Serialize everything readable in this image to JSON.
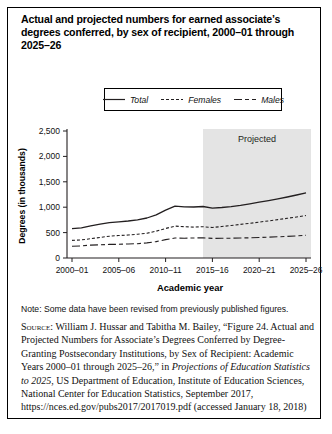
{
  "figure": {
    "title": "Actual and projected numbers for earned associate’s degrees conferred, by sex of recipient, 2000–01 through 2025–26",
    "note": "Note: Some data have been revised from previously published figures.",
    "source": {
      "label": "Source:",
      "intro": " William J. Hussar and Tabitha M. Bailey, “Figure 24. Actual and Projected Numbers for Associate’s Degrees Conferred by Degree-Granting Postsecondary Institutions, by Sex of Recipient: Academic Years 2000–01 through 2025–26,” in ",
      "italic": "Projections of Education Statistics to 2025",
      "rest": ", US Department of Education, Institute of Education Sciences, National Center for Education Statistics, September 2017, https://nces.ed.gov/pubs2017/2017019.pdf (accessed January 18, 2018)"
    }
  },
  "chart_data": {
    "type": "line",
    "title": "Actual and projected numbers for earned associate’s degrees conferred, by sex of recipient, 2000–01 through 2025–26",
    "xlabel": "Academic year",
    "ylabel": "Degrees (in thousands)",
    "ylim": [
      0,
      2500
    ],
    "yticks": [
      0,
      500,
      1000,
      1500,
      2000,
      2500
    ],
    "ytick_labels": [
      "0",
      "500",
      "1,000",
      "1,500",
      "2,000",
      "2,500"
    ],
    "xtick_labels": [
      "2000–01",
      "2005–06",
      "2010–11",
      "2015–16",
      "2020–21",
      "2025–26"
    ],
    "categories": [
      "2000–01",
      "2001–02",
      "2002–03",
      "2003–04",
      "2004–05",
      "2005–06",
      "2006–07",
      "2007–08",
      "2008–09",
      "2009–10",
      "2010–11",
      "2011–12",
      "2012–13",
      "2013–14",
      "2014–15",
      "2015–16",
      "2016–17",
      "2017–18",
      "2018–19",
      "2019–20",
      "2020–21",
      "2021–22",
      "2022–23",
      "2023–24",
      "2024–25",
      "2025–26"
    ],
    "series": [
      {
        "name": "Total",
        "style": "solid",
        "values": [
          579,
          595,
          632,
          665,
          697,
          713,
          728,
          750,
          787,
          849,
          943,
          1021,
          1007,
          1003,
          1014,
          981,
          994,
          1012,
          1038,
          1067,
          1098,
          1130,
          1164,
          1200,
          1240,
          1281
        ]
      },
      {
        "name": "Females",
        "style": "short-dash",
        "values": [
          347,
          357,
          380,
          405,
          429,
          443,
          453,
          468,
          489,
          527,
          581,
          628,
          617,
          609,
          616,
          601,
          620,
          640,
          661,
          683,
          706,
          730,
          755,
          781,
          808,
          836
        ]
      },
      {
        "name": "Males",
        "style": "long-short-dash",
        "values": [
          232,
          238,
          253,
          260,
          268,
          270,
          275,
          282,
          298,
          322,
          362,
          393,
          390,
          394,
          398,
          385,
          387,
          390,
          394,
          398,
          404,
          410,
          417,
          426,
          436,
          447
        ]
      }
    ],
    "projected": {
      "label": "Projected",
      "start_category": "2014–15"
    },
    "legend_position": "top-center",
    "grid": false,
    "colors": {
      "line": "#231f20",
      "projected_fill": "#e4e4e4",
      "text": "#111111"
    }
  }
}
